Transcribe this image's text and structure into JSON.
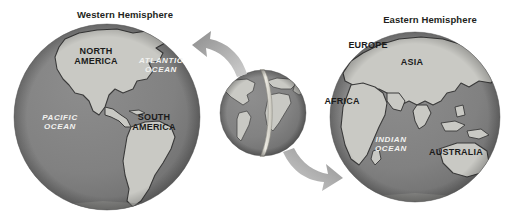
{
  "figure": {
    "title_western": "Western Hemisphere",
    "title_eastern": "Eastern Hemisphere",
    "background_color": "#ffffff"
  },
  "colors": {
    "ocean": "#808080",
    "ocean_shadow": "#6f6f6f",
    "land": "#c9c9c4",
    "land_shadow": "#b0b0aa",
    "coastline": "#3a3a3a",
    "label_land": "#1b1b1b",
    "label_ocean": "#f2f2f0",
    "title": "#231f20",
    "arrow": "#9a9a9a",
    "meridian": "#d9d7cf"
  },
  "globes": {
    "western": {
      "name": "Western Hemisphere globe",
      "labels": {
        "north_america": "NORTH\nAMERICA",
        "north_america_line1": "NORTH",
        "north_america_line2": "AMERICA",
        "south_america_line1": "SOUTH",
        "south_america_line2": "AMERICA",
        "atlantic_line1": "ATLANTIC",
        "atlantic_line2": "OCEAN",
        "pacific_line1": "PACIFIC",
        "pacific_line2": "OCEAN"
      }
    },
    "eastern": {
      "name": "Eastern Hemisphere globe",
      "labels": {
        "europe": "EUROPE",
        "asia": "ASIA",
        "africa": "AFRICA",
        "australia": "AUSTRALIA",
        "indian_line1": "INDIAN",
        "indian_line2": "OCEAN"
      }
    },
    "center": {
      "name": "Whole Earth globe with hemisphere divider"
    }
  },
  "arrows": {
    "top": {
      "label": "arrow from whole Earth to Western Hemisphere",
      "direction": "left"
    },
    "bottom": {
      "label": "arrow from whole Earth to Eastern Hemisphere",
      "direction": "right"
    }
  }
}
